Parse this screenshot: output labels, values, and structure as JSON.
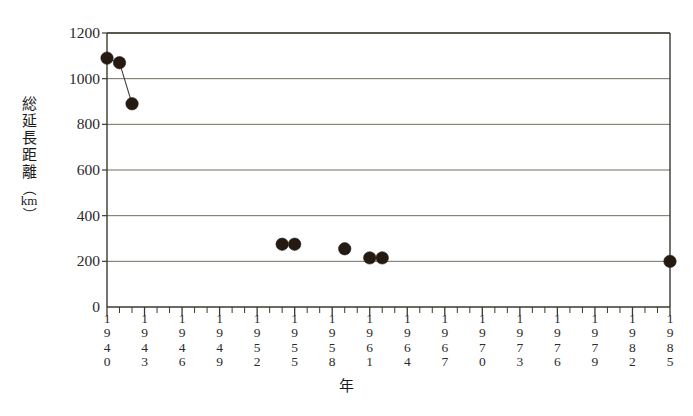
{
  "figure": {
    "background_color": "#ffffff",
    "axis_color": "#3a3a33",
    "grid_color": "#6e6e5e",
    "marker_color": "#241a12",
    "line_color": "#4a4038"
  },
  "axes": {
    "y_title_chars": [
      "総",
      "延",
      "長",
      "距",
      "離"
    ],
    "y_unit_paren_open": "（",
    "y_unit": "km",
    "y_unit_paren_close": "）",
    "x_title": "年",
    "y_ticks": [
      "1200",
      "1000",
      "800",
      "600",
      "400",
      "200",
      "0"
    ],
    "x_ticks": [
      "1940",
      "1943",
      "1946",
      "1949",
      "1952",
      "1955",
      "1958",
      "1961",
      "1964",
      "1967",
      "1970",
      "1973",
      "1976",
      "1979",
      "1982",
      "1985"
    ]
  },
  "chart_data": {
    "type": "scatter",
    "title": "",
    "xlabel": "年",
    "ylabel": "総延長距離（km）",
    "xlim": [
      1940,
      1985
    ],
    "ylim": [
      0,
      1200
    ],
    "ytick_step": 200,
    "xtick_step": 1,
    "xtick_label_step": 3,
    "grid": "horizontal",
    "legend": "none",
    "series": [
      {
        "name": "総延長距離",
        "connected_segments": [
          [
            1940,
            1941,
            1942
          ]
        ],
        "x": [
          1940,
          1941,
          1942,
          1954,
          1955,
          1959,
          1961,
          1962,
          1985
        ],
        "y": [
          1090,
          1070,
          890,
          275,
          275,
          255,
          215,
          215,
          200
        ]
      }
    ]
  }
}
